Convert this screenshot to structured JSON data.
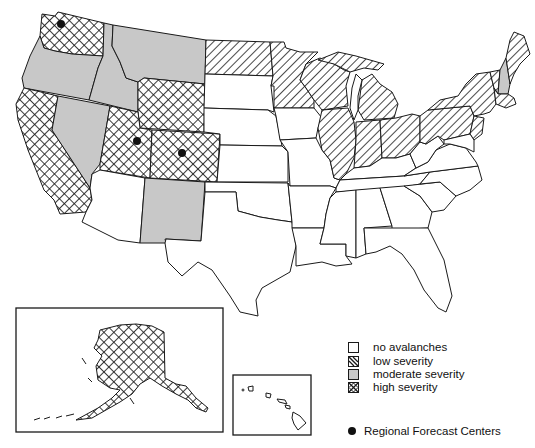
{
  "map": {
    "subject": "Avalanche severity by U.S. state",
    "colors": {
      "outline": "#1a1a1a",
      "no_fill": "#ffffff",
      "moderate_fill": "#c8c8c8",
      "hatch_line": "#1a1a1a",
      "forecast_center": "#111111"
    },
    "categories": {
      "none": {
        "label": "no avalanches",
        "pattern": "white"
      },
      "low": {
        "label": "low severity",
        "pattern": "diagonal-hatch"
      },
      "moderate": {
        "label": "moderate severity",
        "pattern": "gray"
      },
      "high": {
        "label": "high severity",
        "pattern": "cross-hatch"
      }
    },
    "states": {
      "high": [
        "Washington",
        "California",
        "Utah",
        "Colorado",
        "Wyoming",
        "Alaska"
      ],
      "moderate": [
        "Oregon",
        "Idaho",
        "Montana",
        "Nevada",
        "New Mexico",
        "New Hampshire"
      ],
      "low": [
        "North Dakota",
        "Minnesota",
        "Wisconsin",
        "Michigan",
        "Illinois",
        "Indiana",
        "Ohio",
        "Pennsylvania",
        "New York",
        "Vermont",
        "Maine",
        "Massachusetts",
        "Connecticut",
        "New Jersey"
      ],
      "none": [
        "Arizona",
        "South Dakota",
        "Nebraska",
        "Kansas",
        "Oklahoma",
        "Texas",
        "Iowa",
        "Missouri",
        "Arkansas",
        "Louisiana",
        "Kentucky",
        "Tennessee",
        "Mississippi",
        "Alabama",
        "Georgia",
        "Florida",
        "South Carolina",
        "North Carolina",
        "Virginia",
        "West Virginia",
        "Maryland",
        "Delaware",
        "Hawaii"
      ]
    },
    "forecast_centers": [
      {
        "name": "Seattle, WA",
        "x": 61,
        "y": 24
      },
      {
        "name": "Salt Lake City, UT",
        "x": 137,
        "y": 141
      },
      {
        "name": "Colorado center",
        "x": 182,
        "y": 153
      }
    ],
    "insets": [
      "Alaska",
      "Hawaii"
    ]
  },
  "legend": {
    "items": [
      {
        "key": "none",
        "label": "no avalanches"
      },
      {
        "key": "low",
        "label": "low severity"
      },
      {
        "key": "moderate",
        "label": "moderate severity"
      },
      {
        "key": "high",
        "label": "high severity"
      }
    ],
    "forecast_centers_label": "Regional Forecast Centers"
  }
}
